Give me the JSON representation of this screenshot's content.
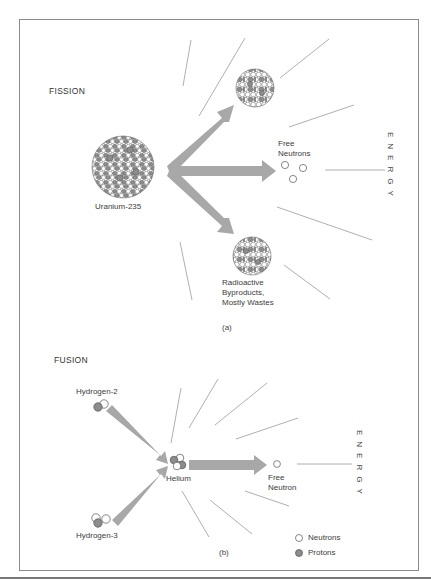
{
  "colors": {
    "frame": "#8a8a8a",
    "arrow": "#a8a8a8",
    "energy_line": "#9a9a9a",
    "neutron_fill": "#ffffff",
    "proton_fill": "#8c8c8c",
    "outline": "#555555"
  },
  "fission": {
    "title": "FISSION",
    "reactant_label": "Uranium-235",
    "free_neutrons_label_line1": "Free",
    "free_neutrons_label_line2": "Neutrons",
    "byproducts_line1": "Radioactive",
    "byproducts_line2": "Byproducts,",
    "byproducts_line3": "Mostly Wastes",
    "energy_label": "ENERGY",
    "caption": "(a)"
  },
  "fusion": {
    "title": "FUSION",
    "reactant1_label": "Hydrogen-2",
    "reactant2_label": "Hydrogen-3",
    "product_label": "Helium",
    "free_neutron_line1": "Free",
    "free_neutron_line2": "Neutron",
    "energy_label": "ENERGY",
    "caption": "(b)"
  },
  "legend": {
    "items": [
      {
        "label": "Neutrons",
        "symbol": "open-circle"
      },
      {
        "label": "Protons",
        "symbol": "filled-circle"
      }
    ]
  }
}
